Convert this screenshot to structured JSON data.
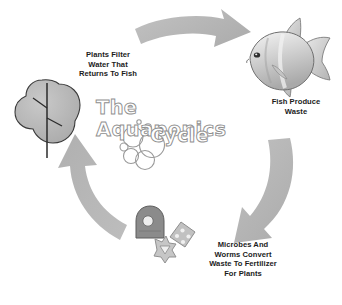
{
  "diagram": {
    "title_line1": "The Aquaponics",
    "title_line2": "Cycle",
    "background_color": "#ffffff",
    "arrow_color": "#b6b6b6",
    "text_color": "#1c1c1c",
    "title_outline_color": "#8f8f8f"
  },
  "captions": {
    "plants": {
      "line1": "Plants Filter",
      "line2": "Water That",
      "line3": "Returns To Fish"
    },
    "fish": {
      "line1": "Fish Produce",
      "line2": "Waste"
    },
    "microbes": {
      "line1": "Microbes And",
      "line2": "Worms Convert",
      "line3": "Waste To Fertilizer",
      "line4": "For Plants"
    }
  },
  "nodes": [
    {
      "id": "plant",
      "icon": "tree-icon",
      "label": "Plants Filter Water That Returns To Fish"
    },
    {
      "id": "fish",
      "icon": "fish-icon",
      "label": "Fish Produce Waste"
    },
    {
      "id": "microbes",
      "icon": "microbe-icon",
      "label": "Microbes And Worms Convert Waste To Fertilizer For Plants"
    }
  ],
  "arrows": [
    {
      "id": "top",
      "from": "plant",
      "to": "fish",
      "direction": "right"
    },
    {
      "id": "right",
      "from": "fish",
      "to": "microbes",
      "direction": "down-left"
    },
    {
      "id": "left",
      "from": "microbes",
      "to": "plant",
      "direction": "up"
    }
  ]
}
